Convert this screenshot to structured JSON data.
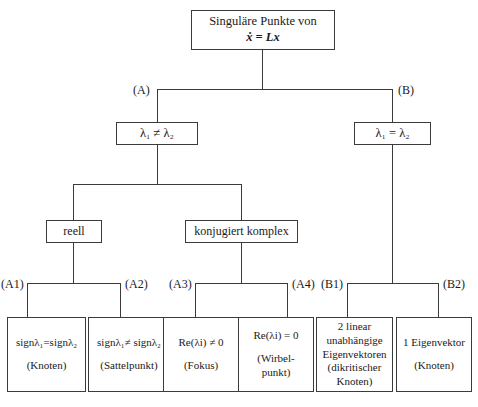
{
  "diagram": {
    "title_box": {
      "line1": "Singuläre Punkte von",
      "line2": "ẋ = Lx"
    },
    "branch_labels": {
      "a": "(A)",
      "b": "(B)",
      "a1": "(A1)",
      "a2": "(A2)",
      "a3": "(A3)",
      "a4": "(A4)",
      "b1": "(B1)",
      "b2": "(B2)"
    },
    "level2": {
      "left": "λ₁ ≠ λ₂",
      "right": "λ₁ = λ₂"
    },
    "level3": {
      "left": "reell",
      "right": "konjugiert komplex"
    },
    "leaves": [
      {
        "id": "a1",
        "line1": "signλ₁=signλ₂",
        "line2": "(Knoten)"
      },
      {
        "id": "a2",
        "line1": "signλ₁≠ signλ₂",
        "line2": "(Sattelpunkt)"
      },
      {
        "id": "a3",
        "line1": "Re(λi) ≠ 0",
        "line2": "(Fokus)"
      },
      {
        "id": "a4",
        "line1": "Re(λi) = 0",
        "line2": "(Wirbel-",
        "line3": "punkt)"
      },
      {
        "id": "b1",
        "line1": "2 linear",
        "line2": "unabhängige",
        "line3": "Eigenvektoren",
        "line4": "(dikritischer",
        "line5": "Knoten)"
      },
      {
        "id": "b2",
        "line1": "1 Eigenvektor",
        "line2": "(Knoten)"
      }
    ],
    "colors": {
      "line": "#3b3b3b",
      "background": "#ffffff",
      "text": "#1a1a1a"
    }
  }
}
